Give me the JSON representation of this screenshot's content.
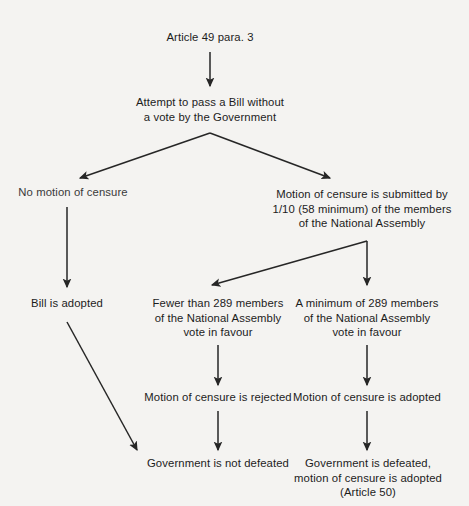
{
  "diagram": {
    "background_color": "#f4f3f1",
    "text_color": "#1c1c1c",
    "arrow_color": "#262626",
    "nodes": {
      "start": "Article 49 para. 3",
      "attempt": "Attempt to pass a Bill without\na vote by the Government",
      "no_motion": "No motion of censure",
      "motion_submitted": "Motion of censure is submitted by\n1/10 (58 minimum) of the members\nof the National Assembly",
      "bill_adopted": "Bill is adopted",
      "fewer_than": "Fewer than 289 members\nof the National Assembly\nvote in favour",
      "minimum_of": "A minimum of 289 members\nof the National Assembly\nvote in favour",
      "motion_rejected": "Motion of censure is rejected",
      "motion_adopted": "Motion of censure is adopted",
      "gov_not_defeated": "Government is not defeated",
      "gov_defeated": "Government is defeated,\nmotion of censure is adopted\n(Article 50)"
    }
  }
}
